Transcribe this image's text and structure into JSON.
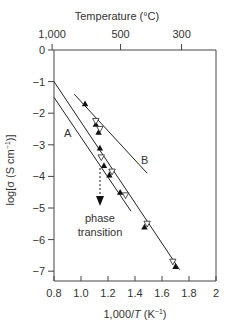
{
  "chart_data": {
    "type": "line",
    "title": "",
    "xlabel": "1,000/T (K⁻¹)",
    "ylabel": "log[σ (S cm⁻¹)]",
    "top_xlabel": "Temperature (°C)",
    "xlim": [
      0.8,
      2.0
    ],
    "ylim": [
      -7.4,
      0
    ],
    "x_ticks": [
      0.8,
      1.0,
      1.2,
      1.4,
      1.6,
      1.8,
      2.0
    ],
    "x_tick_labels": [
      "0.8",
      "1.0",
      "1.2",
      "1.4",
      "1.6",
      "1.8",
      "2"
    ],
    "y_ticks": [
      0,
      -1,
      -2,
      -3,
      -4,
      -5,
      -6,
      -7
    ],
    "y_tick_labels": [
      "0",
      "−1",
      "−2",
      "−3",
      "−4",
      "−5",
      "−6",
      "−7"
    ],
    "top_ticks": [
      {
        "label": "1,000",
        "x": 0.786
      },
      {
        "label": "500",
        "x": 1.293
      },
      {
        "label": "300",
        "x": 1.745
      }
    ],
    "grid": false,
    "series": [
      {
        "name": "upper line",
        "x": [
          0.8,
          1.73
        ],
        "y": [
          -1.0,
          -6.95
        ]
      },
      {
        "name": "A",
        "x": [
          0.8,
          1.37
        ],
        "y": [
          -1.5,
          -5.1
        ]
      },
      {
        "name": "B",
        "x": [
          0.95,
          1.49
        ],
        "y": [
          -1.4,
          -3.9
        ]
      },
      {
        "name": "filled triangles (heating)",
        "marker": "triangle-up-filled",
        "x": [
          1.03,
          1.11,
          1.13,
          1.14,
          1.17,
          1.21,
          1.29,
          1.47,
          1.7
        ],
        "y": [
          -1.7,
          -2.35,
          -2.6,
          -3.1,
          -3.65,
          -3.95,
          -4.5,
          -5.6,
          -6.85
        ]
      },
      {
        "name": "open triangles (cooling)",
        "marker": "triangle-down-open",
        "x": [
          1.11,
          1.14,
          1.15,
          1.23,
          1.33,
          1.49,
          1.68
        ],
        "y": [
          -2.25,
          -2.5,
          -3.4,
          -3.85,
          -4.6,
          -5.5,
          -6.7
        ]
      }
    ],
    "annotations": [
      {
        "text": "A",
        "x": 0.92,
        "y": -2.6
      },
      {
        "text": "B",
        "x": 1.47,
        "y": -3.4
      },
      {
        "text": "phase transition",
        "x": 1.15,
        "y": -4.8,
        "arrow_from": [
          1.15,
          -3.6
        ],
        "arrow_to": [
          1.15,
          -4.4
        ]
      }
    ]
  },
  "labels": {
    "top_title": "Temperature (°C)",
    "x_title_prefix": "1,000/",
    "x_title_T": "T",
    "x_title_suffix": " (K",
    "x_title_sup": "−1",
    "x_title_end": ")",
    "y_title_main": "log[σ (S cm",
    "y_title_sup": "−1",
    "y_title_end": ")]",
    "line_a": "A",
    "line_b": "B",
    "phase_1": "phase",
    "phase_2": "transition"
  }
}
